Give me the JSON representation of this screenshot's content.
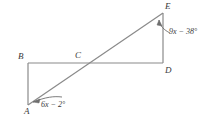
{
  "figure": {
    "type": "geometry-diagram",
    "background_color": "#ffffff",
    "line_color": "#8a8a8a",
    "text_color": "#3a3a3a"
  },
  "points": [
    {
      "name": "A",
      "label": "A",
      "x": 28,
      "y": 105
    },
    {
      "name": "B",
      "label": "B",
      "x": 28,
      "y": 63
    },
    {
      "name": "C",
      "label": "C",
      "x": 78,
      "y": 63
    },
    {
      "name": "D",
      "label": "D",
      "x": 163,
      "y": 63
    },
    {
      "name": "E",
      "label": "E",
      "x": 163,
      "y": 13
    }
  ],
  "segments": [
    {
      "name": "segment-AB",
      "from": "A",
      "to": "B"
    },
    {
      "name": "segment-BD",
      "from": "B",
      "to": "D"
    },
    {
      "name": "segment-DE",
      "from": "D",
      "to": "E"
    },
    {
      "name": "segment-AE",
      "from": "A",
      "to": "E"
    }
  ],
  "angles": [
    {
      "name": "angle-at-A",
      "vertex": "A",
      "expression": "6x − 2°",
      "arrow": "curved-arrow-pointing-to-A"
    },
    {
      "name": "angle-at-E",
      "vertex": "E",
      "expression": "9x − 38°",
      "arrow": "curved-arrow-pointing-to-E"
    }
  ]
}
